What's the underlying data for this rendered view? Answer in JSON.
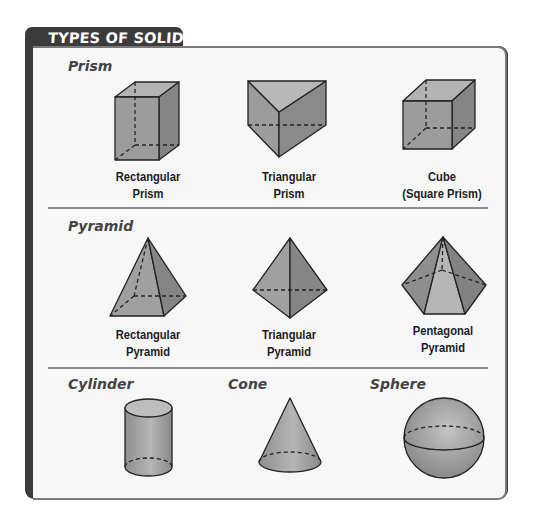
{
  "header": {
    "title": "TYPES OF SOLIDS"
  },
  "sections": [
    {
      "title": "Prism",
      "items": [
        {
          "label_line1": "Rectangular",
          "label_line2": "Prism",
          "shape": "rectangular-prism"
        },
        {
          "label_line1": "Triangular",
          "label_line2": "Prism",
          "shape": "triangular-prism"
        },
        {
          "label_line1": "Cube",
          "label_line2": "(Square Prism)",
          "shape": "cube"
        }
      ]
    },
    {
      "title": "Pyramid",
      "items": [
        {
          "label_line1": "Rectangular",
          "label_line2": "Pyramid",
          "shape": "rectangular-pyramid"
        },
        {
          "label_line1": "Triangular",
          "label_line2": "Pyramid",
          "shape": "triangular-pyramid"
        },
        {
          "label_line1": "Pentagonal",
          "label_line2": "Pyramid",
          "shape": "pentagonal-pyramid"
        }
      ]
    },
    {
      "titles": [
        "Cylinder",
        "Cone",
        "Sphere"
      ],
      "items": [
        {
          "shape": "cylinder"
        },
        {
          "shape": "cone"
        },
        {
          "shape": "sphere"
        }
      ]
    }
  ],
  "colors": {
    "tab": "#3b3b3b",
    "card_bg": "#f7f7f7",
    "shape_fill": "#9a9a9a",
    "stroke": "#222222"
  }
}
